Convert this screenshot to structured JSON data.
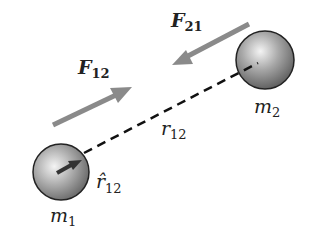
{
  "diagram": {
    "masses": [
      {
        "id": "m1",
        "label": "m",
        "sub": "1"
      },
      {
        "id": "m2",
        "label": "m",
        "sub": "2"
      }
    ],
    "forces": [
      {
        "id": "F12",
        "label": "F",
        "sub": "12",
        "direction": "toward m2"
      },
      {
        "id": "F21",
        "label": "F",
        "sub": "21",
        "direction": "toward m1"
      }
    ],
    "distance": {
      "label": "r",
      "sub": "12"
    },
    "unit_vector": {
      "label": "r̂",
      "sub": "12"
    },
    "colors": {
      "arrow": "#8a8a8a",
      "sphere_dark": "#5a5a5a",
      "sphere_light": "#f2f2f2",
      "line": "#111111"
    }
  }
}
